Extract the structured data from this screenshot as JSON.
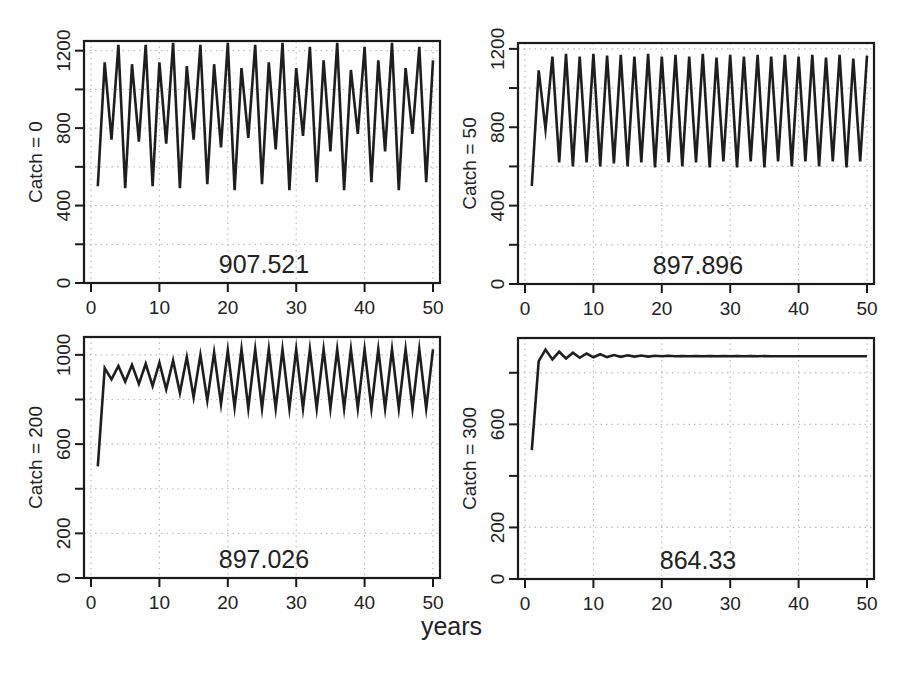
{
  "figure": {
    "xlabel": "years",
    "background": "#ffffff",
    "line_color": "#1e1e1e",
    "grid_color": "#bdbdbd"
  },
  "chart_data": [
    {
      "type": "line",
      "panel": "top-left",
      "ylabel": "Catch = 0",
      "annotation": "907.521",
      "xlabel": "",
      "xlim": [
        0,
        50
      ],
      "ylim": [
        0,
        1250
      ],
      "x_ticks": [
        0,
        10,
        20,
        30,
        40,
        50
      ],
      "y_ticks": [
        0,
        200,
        400,
        600,
        800,
        1000,
        1200
      ],
      "y_tick_labels": [
        "0",
        "",
        "400",
        "",
        "800",
        "",
        "1200"
      ],
      "grid": true,
      "frame": {
        "left": 84,
        "top": 41,
        "right": 440,
        "bottom": 283
      },
      "x": [
        1,
        2,
        3,
        4,
        5,
        6,
        7,
        8,
        9,
        10,
        11,
        12,
        13,
        14,
        15,
        16,
        17,
        18,
        19,
        20,
        21,
        22,
        23,
        24,
        25,
        26,
        27,
        28,
        29,
        30,
        31,
        32,
        33,
        34,
        35,
        36,
        37,
        38,
        39,
        40,
        41,
        42,
        43,
        44,
        45,
        46,
        47,
        48,
        49,
        50
      ],
      "values": [
        500,
        1140,
        740,
        1230,
        490,
        1130,
        730,
        1230,
        500,
        1140,
        720,
        1240,
        490,
        1120,
        740,
        1230,
        510,
        1130,
        700,
        1240,
        480,
        1110,
        750,
        1230,
        510,
        1140,
        690,
        1240,
        480,
        1110,
        760,
        1220,
        520,
        1150,
        680,
        1240,
        480,
        1100,
        770,
        1220,
        520,
        1150,
        680,
        1240,
        480,
        1110,
        770,
        1220,
        520,
        1150
      ]
    },
    {
      "type": "line",
      "panel": "top-right",
      "ylabel": "Catch = 50",
      "annotation": "897.896",
      "xlabel": "",
      "xlim": [
        0,
        50
      ],
      "ylim": [
        0,
        1230
      ],
      "x_ticks": [
        0,
        10,
        20,
        30,
        40,
        50
      ],
      "y_ticks": [
        0,
        200,
        400,
        600,
        800,
        1000,
        1200
      ],
      "y_tick_labels": [
        "0",
        "",
        "400",
        "",
        "800",
        "",
        "1200"
      ],
      "grid": true,
      "frame": {
        "left": 518,
        "top": 43,
        "right": 874,
        "bottom": 284
      },
      "x": [
        1,
        2,
        3,
        4,
        5,
        6,
        7,
        8,
        9,
        10,
        11,
        12,
        13,
        14,
        15,
        16,
        17,
        18,
        19,
        20,
        21,
        22,
        23,
        24,
        25,
        26,
        27,
        28,
        29,
        30,
        31,
        32,
        33,
        34,
        35,
        36,
        37,
        38,
        39,
        40,
        41,
        42,
        43,
        44,
        45,
        46,
        47,
        48,
        49,
        50
      ],
      "values": [
        500,
        1090,
        790,
        1160,
        620,
        1175,
        600,
        1160,
        620,
        1175,
        600,
        1165,
        615,
        1170,
        600,
        1160,
        620,
        1175,
        595,
        1160,
        620,
        1170,
        600,
        1160,
        620,
        1175,
        595,
        1155,
        625,
        1170,
        595,
        1160,
        625,
        1170,
        595,
        1160,
        625,
        1170,
        600,
        1160,
        625,
        1170,
        600,
        1155,
        625,
        1170,
        595,
        1150,
        625,
        1165
      ]
    },
    {
      "type": "line",
      "panel": "bottom-left",
      "ylabel": "Catch = 200",
      "annotation": "897.026",
      "xlabel": "years",
      "xlim": [
        0,
        50
      ],
      "ylim": [
        0,
        1080
      ],
      "x_ticks": [
        0,
        10,
        20,
        30,
        40,
        50
      ],
      "y_ticks": [
        0,
        200,
        400,
        600,
        800,
        1000
      ],
      "y_tick_labels": [
        "0",
        "200",
        "",
        "600",
        "",
        "1000"
      ],
      "grid": true,
      "frame": {
        "left": 84,
        "top": 337,
        "right": 440,
        "bottom": 578
      },
      "x": [
        1,
        2,
        3,
        4,
        5,
        6,
        7,
        8,
        9,
        10,
        11,
        12,
        13,
        14,
        15,
        16,
        17,
        18,
        19,
        20,
        21,
        22,
        23,
        24,
        25,
        26,
        27,
        28,
        29,
        30,
        31,
        32,
        33,
        34,
        35,
        36,
        37,
        38,
        39,
        40,
        41,
        42,
        43,
        44,
        45,
        46,
        47,
        48,
        49,
        50
      ],
      "values": [
        500,
        940,
        890,
        950,
        880,
        955,
        870,
        960,
        860,
        965,
        845,
        975,
        830,
        990,
        810,
        1000,
        795,
        1010,
        780,
        1020,
        765,
        1025,
        760,
        1025,
        760,
        1025,
        760,
        1025,
        760,
        1025,
        760,
        1025,
        760,
        1025,
        760,
        1025,
        760,
        1025,
        760,
        1025,
        760,
        1025,
        760,
        1025,
        760,
        1025,
        760,
        1025,
        760,
        1025
      ]
    },
    {
      "type": "line",
      "panel": "bottom-right",
      "ylabel": "Catch = 300",
      "annotation": "864.33",
      "xlabel": "",
      "xlim": [
        0,
        50
      ],
      "ylim": [
        0,
        935
      ],
      "x_ticks": [
        0,
        10,
        20,
        30,
        40,
        50
      ],
      "y_ticks": [
        0,
        200,
        400,
        600,
        800
      ],
      "y_tick_labels": [
        "0",
        "200",
        "",
        "600",
        ""
      ],
      "grid": true,
      "frame": {
        "left": 518,
        "top": 338,
        "right": 874,
        "bottom": 579
      },
      "x": [
        1,
        2,
        3,
        4,
        5,
        6,
        7,
        8,
        9,
        10,
        11,
        12,
        13,
        14,
        15,
        16,
        17,
        18,
        19,
        20,
        21,
        22,
        23,
        24,
        25,
        26,
        27,
        28,
        29,
        30,
        31,
        32,
        33,
        34,
        35,
        36,
        37,
        38,
        39,
        40,
        41,
        42,
        43,
        44,
        45,
        46,
        47,
        48,
        49,
        50
      ],
      "values": [
        500,
        845,
        890,
        852,
        882,
        856,
        878,
        858,
        875,
        860,
        872,
        861,
        869,
        862,
        868,
        863,
        867,
        863,
        866,
        864,
        866,
        864,
        865,
        864,
        865,
        864,
        865,
        864,
        865,
        864,
        865,
        864,
        865,
        864,
        865,
        864,
        864,
        864,
        864,
        864,
        864,
        864,
        864,
        864,
        864,
        864,
        864,
        864,
        864,
        864
      ]
    }
  ]
}
